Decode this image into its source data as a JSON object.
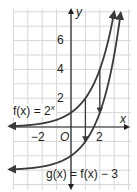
{
  "chart_data": {
    "type": "line",
    "title": "",
    "xlabel": "x",
    "ylabel": "y",
    "xlim": [
      -4.3,
      4.1
    ],
    "ylim": [
      -4.0,
      8.1
    ],
    "grid": true,
    "origin_label": "O",
    "x_tick_labels": [
      "-2",
      "2"
    ],
    "y_tick_labels": [
      "2",
      "4",
      "6"
    ],
    "series": [
      {
        "name": "f(x) = 2^x",
        "label": "f(x) = 2",
        "label_sup": "x",
        "x": [
          -4.3,
          -3,
          -2,
          -1,
          0,
          1,
          2,
          3,
          3.0
        ],
        "y": [
          0.05,
          0.125,
          0.25,
          0.5,
          1,
          2,
          4,
          8,
          8
        ]
      },
      {
        "name": "g(x) = f(x) - 3",
        "label": "g(x) = f(x) − 3",
        "x": [
          -4.3,
          -3,
          -2,
          -1,
          0,
          1,
          2,
          3,
          3.46
        ],
        "y": [
          -2.95,
          -2.875,
          -2.75,
          -2.5,
          -2,
          -1,
          1,
          5,
          8
        ]
      }
    ],
    "annotations": [
      {
        "type": "arrow",
        "from": [
          1,
          2
        ],
        "to": [
          1,
          -1
        ],
        "note": "vertical shift down 3"
      },
      {
        "type": "arrow",
        "from": [
          2,
          4
        ],
        "to": [
          2,
          1
        ],
        "note": "vertical shift down 3"
      }
    ]
  },
  "labels": {
    "x_axis": "x",
    "y_axis": "y",
    "origin": "O",
    "x_neg2": "−2",
    "x_pos2": "2",
    "y2": "2",
    "y4": "4",
    "y6": "6",
    "f_label": "f(x) = 2",
    "f_sup": "x",
    "g_label": "g(x) = f(x) − 3"
  },
  "colors": {
    "curve": "#3a3a3a",
    "axis": "#231f20",
    "grid": "#d6d6d6",
    "text": "#231f20"
  }
}
